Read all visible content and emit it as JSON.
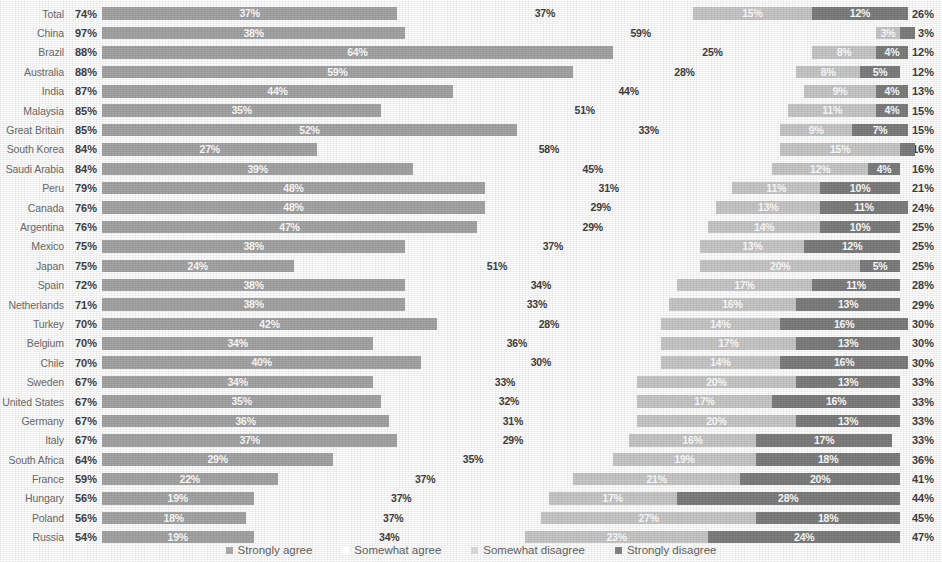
{
  "chart": {
    "type": "bar",
    "title": "",
    "legend": [
      {
        "key": "strongly_agree",
        "label": "Strongly agree",
        "color": "#a6a6a6",
        "swatch": "sw-sa"
      },
      {
        "key": "somewhat_agree",
        "label": "Somewhat agree",
        "color": "#ffffff",
        "swatch": "sw-wa"
      },
      {
        "key": "somewhat_disagree",
        "label": "Somewhat disagree",
        "color": "#d5d5d5",
        "swatch": "sw-wd"
      },
      {
        "key": "strongly_disagree",
        "label": "Strongly disagree",
        "color": "#7f7f7f",
        "swatch": "sw-sd"
      }
    ]
  },
  "chart_data": {
    "type": "bar",
    "orientation": "horizontal",
    "stacked": true,
    "stack_total": 100,
    "title": "",
    "xlabel": "",
    "ylabel": "",
    "xlim": [
      0,
      100
    ],
    "grid": false,
    "legend_position": "bottom",
    "legend": [
      "Strongly agree",
      "Somewhat agree",
      "Somewhat disagree",
      "Strongly disagree"
    ],
    "colors": [
      "#a6a6a6",
      "#ffffff",
      "#c9c9c9",
      "#7f7f7f"
    ],
    "value_suffix": "%",
    "categories": [
      "Total",
      "China",
      "Brazil",
      "Australia",
      "India",
      "Malaysia",
      "Great Britain",
      "South Korea",
      "Saudi Arabia",
      "Peru",
      "Canada",
      "Argentina",
      "Mexico",
      "Japan",
      "Spain",
      "Netherlands",
      "Turkey",
      "Belgium",
      "Chile",
      "Sweden",
      "United States",
      "Germany",
      "Italy",
      "South Africa",
      "France",
      "Hungary",
      "Poland",
      "Russia"
    ],
    "series": [
      {
        "name": "Strongly agree",
        "values": [
          37,
          38,
          64,
          59,
          44,
          35,
          52,
          27,
          39,
          48,
          48,
          47,
          38,
          24,
          38,
          38,
          42,
          34,
          40,
          34,
          35,
          36,
          37,
          29,
          22,
          19,
          18,
          19
        ]
      },
      {
        "name": "Somewhat agree",
        "values": [
          37,
          59,
          25,
          28,
          44,
          51,
          33,
          58,
          45,
          31,
          29,
          29,
          37,
          51,
          34,
          33,
          28,
          36,
          30,
          33,
          32,
          31,
          29,
          35,
          37,
          37,
          37,
          34
        ]
      },
      {
        "name": "Somewhat disagree",
        "values": [
          15,
          3,
          8,
          8,
          9,
          11,
          9,
          15,
          12,
          11,
          13,
          14,
          13,
          20,
          17,
          16,
          15,
          17,
          15,
          20,
          17,
          20,
          16,
          18,
          21,
          16,
          27,
          23
        ]
      },
      {
        "name": "Strongly disagree",
        "values": [
          12,
          1,
          4,
          5,
          4,
          4,
          7,
          1,
          4,
          10,
          11,
          10,
          12,
          5,
          11,
          13,
          16,
          13,
          16,
          13,
          16,
          13,
          17,
          18,
          20,
          28,
          18,
          24
        ]
      }
    ],
    "totals_agree": [
      74,
      97,
      88,
      88,
      87,
      85,
      85,
      84,
      84,
      79,
      76,
      76,
      75,
      75,
      72,
      71,
      70,
      70,
      70,
      67,
      67,
      67,
      67,
      64,
      59,
      56,
      56,
      54
    ],
    "totals_disagree": [
      26,
      3,
      12,
      12,
      13,
      15,
      15,
      16,
      16,
      21,
      24,
      25,
      25,
      25,
      28,
      29,
      30,
      30,
      30,
      33,
      33,
      33,
      33,
      36,
      41,
      44,
      45,
      47
    ]
  },
  "rows": [
    {
      "label": "Total",
      "agree": "74%",
      "sa": 37,
      "sa_label": "37%",
      "wa": 37,
      "wa_label": "37%",
      "wd": 15,
      "wd_label": "15%",
      "sd": 12,
      "sd_label": "12%",
      "disagree": "26%"
    },
    {
      "label": "China",
      "agree": "97%",
      "sa": 38,
      "sa_label": "38%",
      "wa": 59,
      "wa_label": "59%",
      "wd": 3,
      "wd_label": "3%",
      "sd": 1,
      "sd_label": "1%",
      "disagree": "3%"
    },
    {
      "label": "Brazil",
      "agree": "88%",
      "sa": 64,
      "sa_label": "64%",
      "wa": 25,
      "wa_label": "25%",
      "wd": 8,
      "wd_label": "8%",
      "sd": 4,
      "sd_label": "4%",
      "disagree": "12%"
    },
    {
      "label": "Australia",
      "agree": "88%",
      "sa": 59,
      "sa_label": "59%",
      "wa": 28,
      "wa_label": "28%",
      "wd": 8,
      "wd_label": "8%",
      "sd": 5,
      "sd_label": "5%",
      "disagree": "12%"
    },
    {
      "label": "India",
      "agree": "87%",
      "sa": 44,
      "sa_label": "44%",
      "wa": 44,
      "wa_label": "44%",
      "wd": 9,
      "wd_label": "9%",
      "sd": 4,
      "sd_label": "4%",
      "disagree": "13%"
    },
    {
      "label": "Malaysia",
      "agree": "85%",
      "sa": 35,
      "sa_label": "35%",
      "wa": 51,
      "wa_label": "51%",
      "wd": 11,
      "wd_label": "11%",
      "sd": 4,
      "sd_label": "4%",
      "disagree": "15%"
    },
    {
      "label": "Great Britain",
      "agree": "85%",
      "sa": 52,
      "sa_label": "52%",
      "wa": 33,
      "wa_label": "33%",
      "wd": 9,
      "wd_label": "9%",
      "sd": 7,
      "sd_label": "7%",
      "disagree": "15%"
    },
    {
      "label": "South Korea",
      "agree": "84%",
      "sa": 27,
      "sa_label": "27%",
      "wa": 58,
      "wa_label": "58%",
      "wd": 15,
      "wd_label": "15%",
      "sd": 1,
      "sd_label": "1%",
      "disagree": "16%"
    },
    {
      "label": "Saudi Arabia",
      "agree": "84%",
      "sa": 39,
      "sa_label": "39%",
      "wa": 45,
      "wa_label": "45%",
      "wd": 12,
      "wd_label": "12%",
      "sd": 4,
      "sd_label": "4%",
      "disagree": "16%"
    },
    {
      "label": "Peru",
      "agree": "79%",
      "sa": 48,
      "sa_label": "48%",
      "wa": 31,
      "wa_label": "31%",
      "wd": 11,
      "wd_label": "11%",
      "sd": 10,
      "sd_label": "10%",
      "disagree": "21%"
    },
    {
      "label": "Canada",
      "agree": "76%",
      "sa": 48,
      "sa_label": "48%",
      "wa": 29,
      "wa_label": "29%",
      "wd": 13,
      "wd_label": "13%",
      "sd": 11,
      "sd_label": "11%",
      "disagree": "24%"
    },
    {
      "label": "Argentina",
      "agree": "76%",
      "sa": 47,
      "sa_label": "47%",
      "wa": 29,
      "wa_label": "29%",
      "wd": 14,
      "wd_label": "14%",
      "sd": 10,
      "sd_label": "10%",
      "disagree": "25%"
    },
    {
      "label": "Mexico",
      "agree": "75%",
      "sa": 38,
      "sa_label": "38%",
      "wa": 37,
      "wa_label": "37%",
      "wd": 13,
      "wd_label": "13%",
      "sd": 12,
      "sd_label": "12%",
      "disagree": "25%"
    },
    {
      "label": "Japan",
      "agree": "75%",
      "sa": 24,
      "sa_label": "24%",
      "wa": 51,
      "wa_label": "51%",
      "wd": 20,
      "wd_label": "20%",
      "sd": 5,
      "sd_label": "5%",
      "disagree": "25%"
    },
    {
      "label": "Spain",
      "agree": "72%",
      "sa": 38,
      "sa_label": "38%",
      "wa": 34,
      "wa_label": "34%",
      "wd": 17,
      "wd_label": "17%",
      "sd": 11,
      "sd_label": "11%",
      "disagree": "28%"
    },
    {
      "label": "Netherlands",
      "agree": "71%",
      "sa": 38,
      "sa_label": "38%",
      "wa": 33,
      "wa_label": "33%",
      "wd": 16,
      "wd_label": "16%",
      "sd": 13,
      "sd_label": "13%",
      "disagree": "29%"
    },
    {
      "label": "Turkey",
      "agree": "70%",
      "sa": 42,
      "sa_label": "42%",
      "wa": 28,
      "wa_label": "28%",
      "wd": 15,
      "wd_label": "14%",
      "sd": 16,
      "sd_label": "16%",
      "disagree": "30%"
    },
    {
      "label": "Belgium",
      "agree": "70%",
      "sa": 34,
      "sa_label": "34%",
      "wa": 36,
      "wa_label": "36%",
      "wd": 17,
      "wd_label": "17%",
      "sd": 13,
      "sd_label": "13%",
      "disagree": "30%"
    },
    {
      "label": "Chile",
      "agree": "70%",
      "sa": 40,
      "sa_label": "40%",
      "wa": 30,
      "wa_label": "30%",
      "wd": 15,
      "wd_label": "14%",
      "sd": 16,
      "sd_label": "16%",
      "disagree": "30%"
    },
    {
      "label": "Sweden",
      "agree": "67%",
      "sa": 34,
      "sa_label": "34%",
      "wa": 33,
      "wa_label": "33%",
      "wd": 20,
      "wd_label": "20%",
      "sd": 13,
      "sd_label": "13%",
      "disagree": "33%"
    },
    {
      "label": "United States",
      "agree": "67%",
      "sa": 35,
      "sa_label": "35%",
      "wa": 32,
      "wa_label": "32%",
      "wd": 17,
      "wd_label": "17%",
      "sd": 16,
      "sd_label": "16%",
      "disagree": "33%"
    },
    {
      "label": "Germany",
      "agree": "67%",
      "sa": 36,
      "sa_label": "36%",
      "wa": 31,
      "wa_label": "31%",
      "wd": 20,
      "wd_label": "20%",
      "sd": 13,
      "sd_label": "13%",
      "disagree": "33%"
    },
    {
      "label": "Italy",
      "agree": "67%",
      "sa": 37,
      "sa_label": "37%",
      "wa": 29,
      "wa_label": "29%",
      "wd": 16,
      "wd_label": "16%",
      "sd": 17,
      "sd_label": "17%",
      "disagree": "33%"
    },
    {
      "label": "South Africa",
      "agree": "64%",
      "sa": 29,
      "sa_label": "29%",
      "wa": 35,
      "wa_label": "35%",
      "wd": 18,
      "wd_label": "19%",
      "sd": 18,
      "sd_label": "18%",
      "disagree": "36%"
    },
    {
      "label": "France",
      "agree": "59%",
      "sa": 22,
      "sa_label": "22%",
      "wa": 37,
      "wa_label": "37%",
      "wd": 21,
      "wd_label": "21%",
      "sd": 20,
      "sd_label": "20%",
      "disagree": "41%"
    },
    {
      "label": "Hungary",
      "agree": "56%",
      "sa": 19,
      "sa_label": "19%",
      "wa": 37,
      "wa_label": "37%",
      "wd": 16,
      "wd_label": "17%",
      "sd": 28,
      "sd_label": "28%",
      "disagree": "44%"
    },
    {
      "label": "Poland",
      "agree": "56%",
      "sa": 18,
      "sa_label": "18%",
      "wa": 37,
      "wa_label": "37%",
      "wd": 27,
      "wd_label": "27%",
      "sd": 18,
      "sd_label": "18%",
      "disagree": "45%"
    },
    {
      "label": "Russia",
      "agree": "54%",
      "sa": 19,
      "sa_label": "19%",
      "wa": 34,
      "wa_label": "34%",
      "wd": 23,
      "wd_label": "23%",
      "sd": 24,
      "sd_label": "24%",
      "disagree": "47%"
    }
  ]
}
